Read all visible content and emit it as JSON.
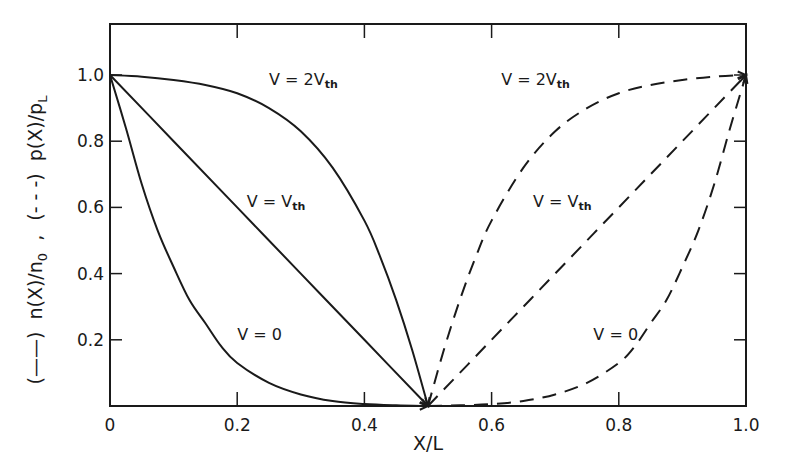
{
  "chart_data": {
    "type": "line",
    "title": "",
    "xlabel": "X/L",
    "ylabel": "(——) n(X)/n_0 , (- - -) p(X)/p_L",
    "ylabel_parts": {
      "solid_marker": "(——)",
      "solid_quantity": "n(X)/n",
      "solid_sub": "0",
      "separator": ",",
      "dashed_marker": "(- - -)",
      "dashed_quantity": "p(X)/p",
      "dashed_sub": "L"
    },
    "xlim": [
      0,
      1.0
    ],
    "ylim": [
      0,
      1.15
    ],
    "x_ticks": [
      0,
      0.2,
      0.4,
      0.6,
      0.8,
      1.0
    ],
    "x_tick_labels": [
      "0",
      "0.2",
      "0.4",
      "0.6",
      "0.8",
      "1.0"
    ],
    "y_ticks": [
      0.2,
      0.4,
      0.6,
      0.8,
      1.0
    ],
    "y_tick_labels": [
      "0.2",
      "0.4",
      "0.6",
      "0.8",
      "1.0"
    ],
    "grid": false,
    "legend": "none (inline labels)",
    "stroke_color": "#1a1a1a",
    "series": [
      {
        "name": "n(X)/n0, V = 0",
        "label_main": "V = 0",
        "style": "solid",
        "label_pos": [
          0.2,
          0.2
        ],
        "x": [
          0,
          0.025,
          0.05,
          0.075,
          0.1,
          0.125,
          0.15,
          0.175,
          0.2,
          0.25,
          0.3,
          0.35,
          0.4,
          0.45,
          0.5
        ],
        "y": [
          1.0,
          0.84,
          0.67,
          0.53,
          0.42,
          0.32,
          0.25,
          0.18,
          0.13,
          0.07,
          0.035,
          0.015,
          0.006,
          0.002,
          0.0
        ]
      },
      {
        "name": "n(X)/n0, V = Vth",
        "label_main": "V = V",
        "label_sub": "th",
        "style": "solid",
        "label_pos": [
          0.215,
          0.6
        ],
        "x": [
          0,
          0.1,
          0.2,
          0.3,
          0.4,
          0.5
        ],
        "y": [
          1.0,
          0.8,
          0.6,
          0.4,
          0.2,
          0.0
        ]
      },
      {
        "name": "n(X)/n0, V = 2Vth",
        "label_main": "V = 2V",
        "label_sub": "th",
        "style": "solid",
        "label_pos": [
          0.25,
          0.97
        ],
        "x": [
          0,
          0.05,
          0.1,
          0.15,
          0.2,
          0.25,
          0.3,
          0.35,
          0.4,
          0.425,
          0.45,
          0.475,
          0.5
        ],
        "y": [
          1.0,
          0.995,
          0.985,
          0.97,
          0.945,
          0.9,
          0.83,
          0.72,
          0.56,
          0.45,
          0.32,
          0.17,
          0.0
        ]
      },
      {
        "name": "p(X)/pL, V = 0",
        "label_main": "V = 0",
        "style": "dashed",
        "label_pos": [
          0.76,
          0.2
        ],
        "x": [
          0.5,
          0.55,
          0.6,
          0.65,
          0.7,
          0.75,
          0.8,
          0.825,
          0.85,
          0.875,
          0.9,
          0.925,
          0.95,
          0.975,
          1.0
        ],
        "y": [
          0.0,
          0.002,
          0.006,
          0.015,
          0.035,
          0.07,
          0.13,
          0.18,
          0.25,
          0.32,
          0.42,
          0.53,
          0.67,
          0.84,
          1.0
        ]
      },
      {
        "name": "p(X)/pL, V = Vth",
        "label_main": "V = V",
        "label_sub": "th",
        "style": "dashed",
        "label_pos": [
          0.665,
          0.6
        ],
        "x": [
          0.5,
          0.6,
          0.7,
          0.8,
          0.9,
          1.0
        ],
        "y": [
          0.0,
          0.2,
          0.4,
          0.6,
          0.8,
          1.0
        ]
      },
      {
        "name": "p(X)/pL, V = 2Vth",
        "label_main": "V = 2V",
        "label_sub": "th",
        "style": "dashed",
        "label_pos": [
          0.615,
          0.97
        ],
        "x": [
          0.5,
          0.525,
          0.55,
          0.575,
          0.6,
          0.65,
          0.7,
          0.75,
          0.8,
          0.85,
          0.9,
          0.95,
          1.0
        ],
        "y": [
          0.0,
          0.17,
          0.32,
          0.45,
          0.56,
          0.72,
          0.83,
          0.9,
          0.945,
          0.97,
          0.985,
          0.995,
          1.0
        ]
      }
    ]
  }
}
